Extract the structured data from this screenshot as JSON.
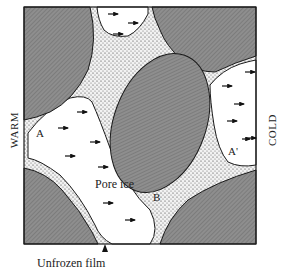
{
  "diagram": {
    "labels": {
      "left_side": "WARM",
      "right_side": "COLD",
      "pore_ice": "Pore ice",
      "point_a": "A",
      "point_a_prime": "A'",
      "point_b": "B",
      "unfrozen_film": "Unfrozen film"
    },
    "colors": {
      "grain": "#8c8c8c",
      "pore_ice": "#ffffff",
      "film": "#e6e6e6",
      "outline": "#1a1a1a"
    }
  }
}
